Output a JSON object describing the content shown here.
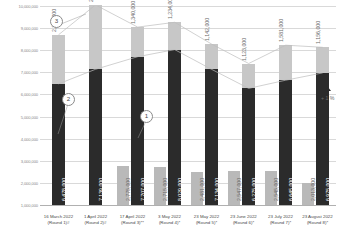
{
  "chart_data": {
    "type": "bar",
    "title": "",
    "subtitle": "",
    "xlabel": "",
    "ylabel": "",
    "ylim": [
      1000000,
      10000000
    ],
    "grid": true,
    "legend_position": "none",
    "categories": [
      "16 March 2022 (Round 1)#",
      "1 April 2022 (Round 2)#",
      "17 April 2022 (Round 3)**",
      "3 May 2022 (Round 4)*",
      "23 May 2022 (Round 5)*",
      "23 June 2022 (Round 6)*",
      "23 July 2022 (Round 7)*",
      "23 August 2022 (Round 8)*"
    ],
    "category_lines": [
      [
        "16 March 2022",
        "(Round 1)#"
      ],
      [
        "1 April 2022",
        "(Round 2)#"
      ],
      [
        "17 April 2022",
        "(Round 3)**"
      ],
      [
        "3 May 2022",
        "(Round 4)*"
      ],
      [
        "23 May 2022",
        "(Round 5)*"
      ],
      [
        "23 June 2022",
        "(Round 6)*"
      ],
      [
        "23 July 2022",
        "(Round 7)*"
      ],
      [
        "23 August 2022",
        "(Round 8)*"
      ]
    ],
    "yticks": [
      "10,000,000",
      "9,000,000",
      "8,000,000",
      "7,000,000",
      "6,000,000",
      "5,000,000",
      "4,000,000",
      "3,000,000",
      "2,000,000",
      "1,000,000"
    ],
    "ytick_values": [
      10000000,
      9000000,
      8000000,
      7000000,
      6000000,
      5000000,
      4000000,
      3000000,
      2000000,
      1000000
    ],
    "series": [
      {
        "name": "lower",
        "color": "#2b2b2b",
        "values": [
          6478000,
          7139000,
          7707000,
          8029000,
          7134000,
          6275000,
          6645000,
          6975000
        ],
        "labels": [
          "6,478,000",
          "7,139,000",
          "7,707,000",
          "8,029,000",
          "7,134,000",
          "6,275,000",
          "6,645,000",
          "6,975,000"
        ]
      },
      {
        "name": "upper",
        "color": "#c7c7c7",
        "values": [
          2218000,
          2910000,
          1340000,
          1234000,
          1142000,
          1123000,
          1581000,
          1156000
        ],
        "labels": [
          "2,218,000",
          "2,910,000",
          "1,340,000",
          "1,234,000",
          "1,142,000",
          "1,123,000",
          "1,581,000",
          "1,156,000"
        ]
      },
      {
        "name": "secondary",
        "color": "#b9b9b9",
        "values": [
          null,
          null,
          2775000,
          2715000,
          2481000,
          2547000,
          2545000,
          2013000
        ],
        "labels": [
          "",
          "",
          "2,775,000",
          "2,715,000",
          "2,481,000",
          "2,547,000",
          "2,545,000",
          "2,013,000"
        ]
      }
    ],
    "annotations": [
      {
        "name": "callout-1",
        "text": "1"
      },
      {
        "name": "callout-2",
        "text": "2"
      },
      {
        "name": "callout-3",
        "text": "3"
      },
      {
        "name": "percent-change",
        "text": "+ 1 %"
      }
    ]
  }
}
